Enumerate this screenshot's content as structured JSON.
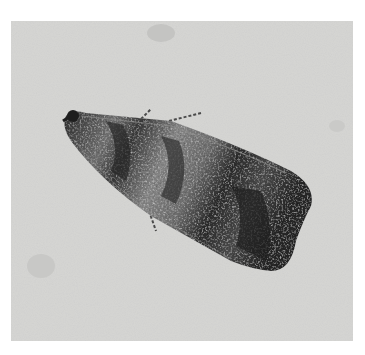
{
  "image": {
    "subject": "moth",
    "description": "Grayscale photograph of a moth with mottled dark wings, resting on a light speckled surface",
    "colors": {
      "border": "#ffffff",
      "background": "#d6d6d4",
      "wing_dark": "#2a2a2a",
      "wing_mid": "#6a6a6a",
      "wing_light": "#9a9a98"
    }
  }
}
